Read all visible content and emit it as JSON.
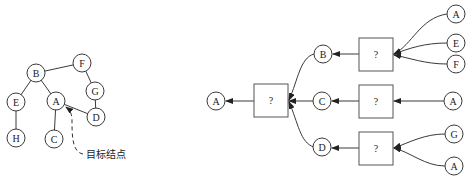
{
  "left_graph": {
    "nodes": [
      {
        "id": "B",
        "label": "B",
        "x": 36,
        "y": 73
      },
      {
        "id": "F",
        "label": "F",
        "x": 82,
        "y": 63
      },
      {
        "id": "G",
        "label": "G",
        "x": 95,
        "y": 91
      },
      {
        "id": "E",
        "label": "E",
        "x": 16,
        "y": 102
      },
      {
        "id": "A",
        "label": "A",
        "x": 56,
        "y": 101
      },
      {
        "id": "D",
        "label": "D",
        "x": 96,
        "y": 117
      },
      {
        "id": "H",
        "label": "H",
        "x": 16,
        "y": 138
      },
      {
        "id": "C",
        "label": "C",
        "x": 54,
        "y": 139
      }
    ],
    "edges": [
      [
        "B",
        "F"
      ],
      [
        "F",
        "G"
      ],
      [
        "G",
        "D"
      ],
      [
        "B",
        "E"
      ],
      [
        "B",
        "A"
      ],
      [
        "A",
        "D"
      ],
      [
        "E",
        "H"
      ],
      [
        "A",
        "C"
      ]
    ],
    "target_label": "目标结点",
    "target_node": "A"
  },
  "right_diagram": {
    "output_node": {
      "label": "A",
      "x": 216,
      "y": 103
    },
    "center_box": {
      "label": "?",
      "x": 254,
      "y": 84,
      "w": 34,
      "h": 33
    },
    "branches": [
      {
        "node": {
          "label": "B",
          "x": 323,
          "y": 54
        },
        "box": {
          "label": "?",
          "x": 359,
          "y": 38,
          "w": 34,
          "h": 33
        },
        "inputs": [
          {
            "label": "A",
            "x": 456,
            "y": 14
          },
          {
            "label": "E",
            "x": 456,
            "y": 43
          },
          {
            "label": "F",
            "x": 456,
            "y": 64
          }
        ]
      },
      {
        "node": {
          "label": "C",
          "x": 322,
          "y": 102
        },
        "box": {
          "label": "?",
          "x": 359,
          "y": 85,
          "w": 34,
          "h": 33
        },
        "inputs": [
          {
            "label": "A",
            "x": 453,
            "y": 102
          }
        ]
      },
      {
        "node": {
          "label": "D",
          "x": 322,
          "y": 147
        },
        "box": {
          "label": "?",
          "x": 359,
          "y": 132,
          "w": 34,
          "h": 33
        },
        "inputs": [
          {
            "label": "G",
            "x": 454,
            "y": 134
          },
          {
            "label": "A",
            "x": 454,
            "y": 166
          }
        ]
      }
    ]
  },
  "colors": {
    "stroke": "#3a3a3a",
    "box_stroke": "#555555",
    "background": "#ffffff"
  }
}
